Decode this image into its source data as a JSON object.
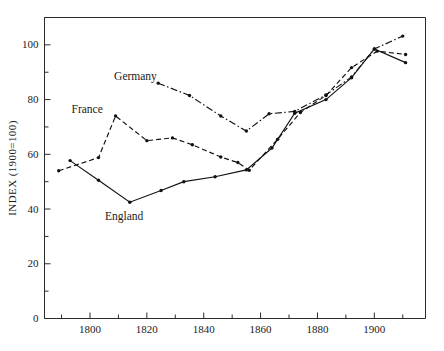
{
  "chart_data": {
    "type": "line",
    "title": "",
    "xlabel": "",
    "ylabel": "INDEX  (1900=100)",
    "xlim": [
      1784,
      1918
    ],
    "ylim": [
      0,
      110
    ],
    "xticks": [
      1800,
      1820,
      1840,
      1860,
      1880,
      1900
    ],
    "xticklabels": [
      "1800",
      "1820",
      "1840",
      "1860",
      "1880",
      "1900"
    ],
    "xminorticks": [
      1790,
      1810,
      1830,
      1850,
      1870,
      1890,
      1910
    ],
    "yticks": [
      0,
      20,
      40,
      60,
      80,
      100
    ],
    "yticklabels": [
      "0",
      "20",
      "40",
      "60",
      "80",
      "100"
    ],
    "yminorticks": [
      10,
      30,
      50,
      70,
      90,
      110
    ],
    "grid": false,
    "legend_position": "inline-annotations",
    "series": [
      {
        "name": "England",
        "style": "solid",
        "label_text": "England",
        "label_x": 1812,
        "label_y": 36,
        "points": [
          {
            "x": 1793,
            "y": 57.7
          },
          {
            "x": 1803,
            "y": 50.5
          },
          {
            "x": 1814,
            "y": 42.5
          },
          {
            "x": 1825,
            "y": 46.8
          },
          {
            "x": 1833,
            "y": 50.0
          },
          {
            "x": 1844,
            "y": 51.8
          },
          {
            "x": 1855,
            "y": 54.3
          },
          {
            "x": 1864,
            "y": 62.3
          },
          {
            "x": 1872,
            "y": 75.0
          },
          {
            "x": 1883,
            "y": 80.0
          },
          {
            "x": 1892,
            "y": 88.0
          },
          {
            "x": 1900,
            "y": 98.5
          },
          {
            "x": 1911,
            "y": 93.5
          }
        ]
      },
      {
        "name": "France",
        "style": "dashed",
        "label_text": "France",
        "label_x": 1799,
        "label_y": 75,
        "points": [
          {
            "x": 1789,
            "y": 54.0
          },
          {
            "x": 1803,
            "y": 58.8
          },
          {
            "x": 1809,
            "y": 74.0
          },
          {
            "x": 1820,
            "y": 65.0
          },
          {
            "x": 1829,
            "y": 66.0
          },
          {
            "x": 1836,
            "y": 63.5
          },
          {
            "x": 1846,
            "y": 59.0
          },
          {
            "x": 1852,
            "y": 57.0
          },
          {
            "x": 1856,
            "y": 54.2
          },
          {
            "x": 1866,
            "y": 65.5
          },
          {
            "x": 1874,
            "y": 75.3
          },
          {
            "x": 1883,
            "y": 81.5
          },
          {
            "x": 1892,
            "y": 91.7
          },
          {
            "x": 1901,
            "y": 97.7
          },
          {
            "x": 1911,
            "y": 96.5
          }
        ]
      },
      {
        "name": "Germany",
        "style": "dashdot",
        "label_text": "Germany",
        "label_x": 1816,
        "label_y": 87,
        "points": [
          {
            "x": 1824,
            "y": 86.0
          },
          {
            "x": 1835,
            "y": 81.5
          },
          {
            "x": 1846,
            "y": 74.0
          },
          {
            "x": 1855,
            "y": 68.5
          },
          {
            "x": 1863,
            "y": 74.8
          },
          {
            "x": 1872,
            "y": 75.7
          },
          {
            "x": 1883,
            "y": 81.7
          },
          {
            "x": 1892,
            "y": 88.3
          },
          {
            "x": 1900,
            "y": 98.5
          },
          {
            "x": 1910,
            "y": 103.2
          }
        ]
      }
    ]
  }
}
